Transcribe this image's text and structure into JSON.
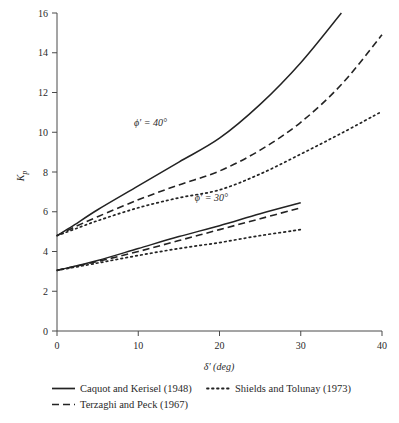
{
  "figure": {
    "background_color": "#ffffff",
    "line_color": "#232323",
    "axis_color": "#4a4a4a"
  },
  "axes": {
    "x": {
      "label": "δ′ (deg)",
      "min": 0,
      "max": 40,
      "ticks": [
        0,
        10,
        20,
        30,
        40
      ],
      "tick_labels": [
        "0",
        "10",
        "20",
        "30",
        "40"
      ]
    },
    "y": {
      "label": "K",
      "label_sub": "p",
      "min": 0,
      "max": 16,
      "ticks": [
        0,
        2,
        4,
        6,
        8,
        10,
        12,
        14,
        16
      ],
      "tick_labels": [
        "0",
        "2",
        "4",
        "6",
        "8",
        "10",
        "12",
        "14",
        "16"
      ]
    }
  },
  "annotations": [
    {
      "text": "ϕ′ = 40°",
      "x_deg": 11.5,
      "y_kp": 10.3
    },
    {
      "text": "ϕ′ = 30°",
      "x_deg": 19.0,
      "y_kp": 6.55
    }
  ],
  "legend": {
    "entries": [
      {
        "label": "Caquot and Kerisel (1948)",
        "style": "solid"
      },
      {
        "label": "Terzaghi and Peck (1967)",
        "style": "dashed"
      },
      {
        "label": "Shields and Tolunay (1973)",
        "style": "dotted"
      }
    ]
  },
  "chart_data": {
    "type": "line",
    "title": "",
    "xlabel": "δ′ (deg)",
    "ylabel": "Kp",
    "xlim": [
      0,
      40
    ],
    "ylim": [
      0,
      16
    ],
    "grid": false,
    "legend_position": "below-axes",
    "series": [
      {
        "name": "Caquot and Kerisel (1948), ϕ′ = 40°",
        "style": "solid",
        "phi_deg": 40,
        "x": [
          0,
          2,
          5,
          10,
          15,
          20,
          25,
          30,
          35
        ],
        "y": [
          4.8,
          5.3,
          6.1,
          7.3,
          8.5,
          9.7,
          11.4,
          13.5,
          16.0
        ]
      },
      {
        "name": "Terzaghi and Peck (1967), ϕ′ = 40°",
        "style": "dashed",
        "phi_deg": 40,
        "x": [
          0,
          2,
          5,
          10,
          15,
          20,
          25,
          30,
          35,
          40
        ],
        "y": [
          4.8,
          5.2,
          5.75,
          6.6,
          7.35,
          8.05,
          9.1,
          10.5,
          12.4,
          14.9
        ]
      },
      {
        "name": "Shields and Tolunay (1973), ϕ′ = 40°",
        "style": "dotted",
        "phi_deg": 40,
        "x": [
          0,
          2,
          5,
          10,
          15,
          20,
          25,
          30,
          35,
          40
        ],
        "y": [
          4.8,
          5.1,
          5.55,
          6.2,
          6.7,
          7.1,
          7.9,
          8.9,
          9.95,
          11.05
        ]
      },
      {
        "name": "Caquot and Kerisel (1948), ϕ′ = 30°",
        "style": "solid",
        "phi_deg": 30,
        "x": [
          0,
          5,
          10,
          15,
          20,
          25,
          30
        ],
        "y": [
          3.05,
          3.55,
          4.15,
          4.75,
          5.3,
          5.9,
          6.45
        ]
      },
      {
        "name": "Terzaghi and Peck (1967), ϕ′ = 30°",
        "style": "dashed",
        "phi_deg": 30,
        "x": [
          0,
          5,
          10,
          15,
          20,
          25,
          30
        ],
        "y": [
          3.05,
          3.5,
          4.0,
          4.55,
          5.1,
          5.65,
          6.2
        ]
      },
      {
        "name": "Shields and Tolunay (1973), ϕ′ = 30°",
        "style": "dotted",
        "phi_deg": 30,
        "x": [
          0,
          5,
          10,
          15,
          20,
          25,
          30
        ],
        "y": [
          3.05,
          3.42,
          3.8,
          4.15,
          4.45,
          4.8,
          5.1
        ]
      }
    ]
  }
}
